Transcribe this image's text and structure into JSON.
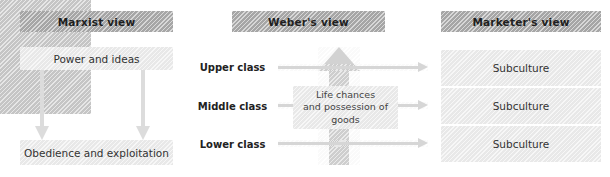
{
  "diagram": {
    "columns": [
      {
        "id": "marxist",
        "header": "Marxist view",
        "top_box": "Power and ideas",
        "bottom_box": "Obedience and exploitation",
        "arrows": 2,
        "arrow_direction": "down"
      },
      {
        "id": "weber",
        "header": "Weber's view",
        "classes": [
          "Upper class",
          "Middle class",
          "Lower class"
        ],
        "center_box": {
          "line1": "Life chances",
          "line2": "and possession of",
          "line3": "goods"
        },
        "vertical_arrow_direction": "up",
        "horizontal_arrow_direction": "right",
        "horizontal_arrow_count": 3
      },
      {
        "id": "marketer",
        "header": "Marketer's view",
        "rows": [
          "Subculture",
          "Subculture",
          "Subculture"
        ]
      }
    ]
  },
  "colors": {
    "header_bar": "#a9a9a9",
    "light_panel": "#ededed",
    "class_panel": "#c9c9c9",
    "arrow": "#d6d6d6",
    "big_arrow": "#d2d2d2",
    "header_text": "#1f1f1f",
    "body_text": "#333333",
    "background": "#ffffff"
  }
}
